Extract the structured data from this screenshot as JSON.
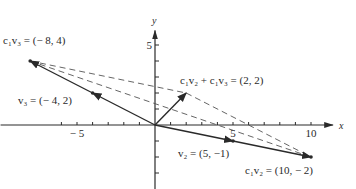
{
  "diagram": {
    "axes": {
      "x_label": "x",
      "y_label": "y",
      "x_ticks": [
        -6,
        -5,
        -4,
        -3,
        -2,
        -1,
        1,
        2,
        3,
        4,
        5,
        6,
        7,
        8,
        9,
        10
      ],
      "y_ticks": [
        -3,
        -2,
        -1,
        1,
        2,
        3,
        4,
        5
      ],
      "x_tick_labels": [
        {
          "value": -5,
          "text": "− 5"
        },
        {
          "value": 5,
          "text": "5"
        },
        {
          "value": 10,
          "text": "10"
        }
      ],
      "y_tick_labels": [
        {
          "value": 5,
          "text": "5"
        }
      ]
    },
    "vectors": [
      {
        "name": "v3",
        "from": [
          0,
          0
        ],
        "to": [
          -4,
          2
        ],
        "label": "v₃ = (− 4,  2)"
      },
      {
        "name": "c1v3",
        "from": [
          0,
          0
        ],
        "to": [
          -8,
          4
        ],
        "label": "c₁v₃ = (− 8,  4)"
      },
      {
        "name": "v2",
        "from": [
          0,
          0
        ],
        "to": [
          5,
          -1
        ],
        "label": "v₂ = (5,  −1)"
      },
      {
        "name": "c1v2",
        "from": [
          0,
          0
        ],
        "to": [
          10,
          -2
        ],
        "label": "c₁v₂ = (10,  − 2)"
      },
      {
        "name": "sum",
        "from": [
          0,
          0
        ],
        "to": [
          2,
          2
        ],
        "label": "c₁v₂ + c₁v₃ = (2,  2)"
      }
    ],
    "dashed_lines": [
      {
        "from": [
          -8,
          4
        ],
        "to": [
          10,
          -2
        ]
      },
      {
        "from": [
          -8,
          4
        ],
        "to": [
          2,
          2
        ]
      },
      {
        "from": [
          2,
          2
        ],
        "to": [
          10,
          -2
        ]
      }
    ],
    "colors": {
      "line": "#2a2a2a",
      "dashed": "#555555"
    }
  }
}
